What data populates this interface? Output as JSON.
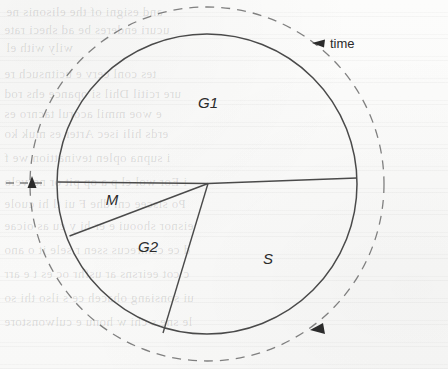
{
  "figure": {
    "kind": "cell-cycle-pie-diagram",
    "background_color": "#fbfbfa",
    "ink_color": "#3a3a3a"
  },
  "annotations": {
    "time_label": "time",
    "time_arrow_direction": "counterclockwise"
  },
  "chart_data": {
    "type": "pie",
    "title": "",
    "subtitle": "",
    "xlabel": "",
    "ylabel": "",
    "legend_position": "inside-slices",
    "grid": false,
    "direction": "counterclockwise",
    "start_angle_deg": 0,
    "units": "fraction of cell cycle",
    "categories": [
      "G1",
      "S",
      "G2",
      "M"
    ],
    "values": [
      50,
      30,
      14,
      6
    ],
    "slices": [
      {
        "label": "G1",
        "value": 50,
        "start_angle_deg": 0,
        "end_angle_deg": 180,
        "label_x": 208,
        "label_y": 108
      },
      {
        "label": "M",
        "value": 6,
        "start_angle_deg": 180,
        "end_angle_deg": 200,
        "label_x": 112,
        "label_y": 205
      },
      {
        "label": "G2",
        "value": 14,
        "start_angle_deg": 200,
        "end_angle_deg": 251,
        "label_x": 148,
        "label_y": 252
      },
      {
        "label": "S",
        "value": 30,
        "start_angle_deg": 251,
        "end_angle_deg": 360,
        "label_x": 268,
        "label_y": 264
      }
    ],
    "geometry": {
      "center_x": 207,
      "center_y": 184,
      "solid_radius": 150,
      "dashed_radius": 177
    },
    "annotations": [
      "time"
    ]
  },
  "bleed_through_lines": [
    {
      "text": "and  esigni of the   elisonis ne",
      "x": 6,
      "y": 4
    },
    {
      "text": "ucuri  enderes  be   ad sheci rate",
      "x": 4,
      "y": 22
    },
    {
      "text": "wily  with   el",
      "x": 6,
      "y": 40
    },
    {
      "text": "tes  conl  cerv  e   ucitnsuch re",
      "x": 4,
      "y": 66
    },
    {
      "text": "ure  rcitil Dhil  si  opance  ehs rod",
      "x": 4,
      "y": 86
    },
    {
      "text": "e  woe mmil  acorul  tacnro es",
      "x": 4,
      "y": 106
    },
    {
      "text": "erds  hili isec   Arter  es  muk  ko",
      "x": 4,
      "y": 126
    },
    {
      "text": "i  supna   oplen  tevinattion   we  f",
      "x": 4,
      "y": 150
    },
    {
      "text": "i  Eor  wol  cl   p  a   op  pit  or   nervelo",
      "x": 4,
      "y": 174
    },
    {
      "text": "Po  siscee  cni   dhe   F   ui   tl  hi  cuole",
      "x": 4,
      "y": 196
    },
    {
      "text": "eisnor  shooui   e   er   hi   y   cu   as  oicae",
      "x": 4,
      "y": 218
    },
    {
      "text": "d  ce   cemrecus  ssen  r   sele   it  o ano",
      "x": 4,
      "y": 242
    },
    {
      "text": "c  cot  eeirsns  ar  usfhr  oc   es  t  e  arr",
      "x": 4,
      "y": 266
    },
    {
      "text": "ui  sonsiang  ohaceh   ce  s  ilso  thi  so",
      "x": 4,
      "y": 290
    },
    {
      "text": "le  sne  s  chi  w  honu  e   culwonstore",
      "x": 4,
      "y": 314
    }
  ]
}
